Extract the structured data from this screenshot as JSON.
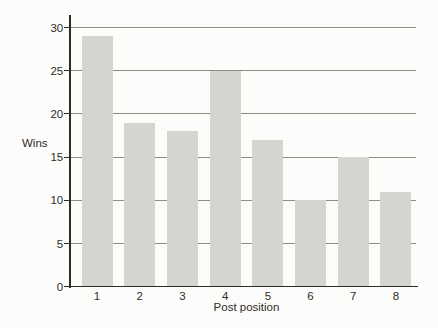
{
  "chart_data": {
    "type": "bar",
    "title": "",
    "xlabel": "Post position",
    "ylabel": "Wins",
    "categories": [
      "1",
      "2",
      "3",
      "4",
      "5",
      "6",
      "7",
      "8"
    ],
    "values": [
      29,
      19,
      18,
      25,
      17,
      10,
      15,
      11
    ],
    "ylim": [
      0,
      30
    ],
    "yticks": [
      0,
      5,
      10,
      15,
      20,
      25,
      30
    ],
    "grid": "horizontal gridlines at each labeled y tick, drawn behind bars",
    "legend": "none",
    "colors": {
      "background": "#fcfcfa",
      "bar_fill": "#d5d4d1",
      "gridline": "#8e8c87",
      "axis_and_text": "#2f2d2a"
    }
  }
}
